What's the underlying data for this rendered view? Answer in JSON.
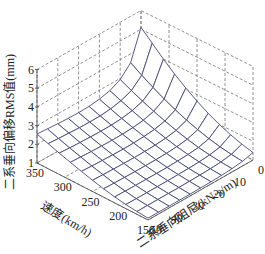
{
  "chart_data": {
    "type": "surface3d",
    "title": "",
    "xlabel": "速度(km/h)",
    "ylabel": "二系垂向阻尼(kN·s/m)",
    "zlabel": "二系垂向偏移RMS值(mm)",
    "x_ticks": [
      "150",
      "200",
      "250",
      "300",
      "350"
    ],
    "y_ticks": [
      "0",
      "10",
      "20",
      "30",
      "40",
      "50"
    ],
    "z_ticks": [
      "1",
      "2",
      "3",
      "4",
      "5",
      "6"
    ],
    "xlim": [
      150,
      350
    ],
    "ylim": [
      0,
      50
    ],
    "zlim": [
      1,
      6
    ],
    "grid_lines": "dashed",
    "mesh_color": "#4a4a7a",
    "speed_values": [
      150,
      170,
      190,
      210,
      230,
      250,
      270,
      290,
      310,
      330,
      350
    ],
    "damping_values": [
      0,
      5,
      10,
      15,
      20,
      25,
      30,
      35,
      40,
      45,
      50
    ],
    "z_values": [
      [
        1.4,
        1.25,
        1.18,
        1.14,
        1.12,
        1.11,
        1.1,
        1.1,
        1.1,
        1.1,
        1.1
      ],
      [
        1.55,
        1.32,
        1.23,
        1.19,
        1.17,
        1.16,
        1.15,
        1.15,
        1.15,
        1.15,
        1.15
      ],
      [
        1.75,
        1.42,
        1.31,
        1.26,
        1.23,
        1.22,
        1.21,
        1.21,
        1.21,
        1.21,
        1.22
      ],
      [
        2.0,
        1.56,
        1.41,
        1.35,
        1.32,
        1.3,
        1.3,
        1.3,
        1.3,
        1.31,
        1.32
      ],
      [
        2.3,
        1.74,
        1.55,
        1.47,
        1.43,
        1.41,
        1.41,
        1.41,
        1.42,
        1.43,
        1.45
      ],
      [
        2.65,
        1.95,
        1.72,
        1.62,
        1.57,
        1.55,
        1.54,
        1.55,
        1.56,
        1.58,
        1.6
      ],
      [
        3.05,
        2.2,
        1.92,
        1.79,
        1.73,
        1.7,
        1.69,
        1.7,
        1.72,
        1.74,
        1.77
      ],
      [
        3.5,
        2.48,
        2.14,
        1.98,
        1.9,
        1.87,
        1.86,
        1.87,
        1.89,
        1.92,
        1.95
      ],
      [
        4.0,
        2.8,
        2.38,
        2.19,
        2.09,
        2.05,
        2.04,
        2.05,
        2.07,
        2.1,
        2.14
      ],
      [
        4.55,
        3.15,
        2.65,
        2.42,
        2.3,
        2.24,
        2.23,
        2.24,
        2.27,
        2.3,
        2.34
      ],
      [
        5.1,
        3.52,
        2.94,
        2.66,
        2.52,
        2.45,
        2.43,
        2.44,
        2.47,
        2.51,
        2.55
      ]
    ]
  }
}
